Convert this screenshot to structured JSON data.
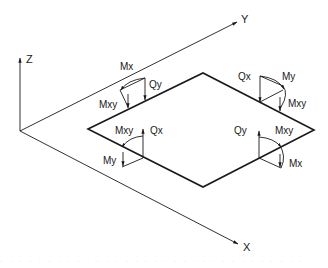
{
  "figure": {
    "colors": {
      "line": "#1a1a1a",
      "background": "#ffffff"
    }
  },
  "axes": {
    "z_label": "Z",
    "y_label": "Y",
    "x_label": "X"
  },
  "corners": {
    "top_left": {
      "shear": "Qy",
      "moment_arc": "Mx",
      "moment_vec": "Mxy"
    },
    "top_right": {
      "shear": "Qx",
      "moment_arc": "My",
      "moment_vec": "Mxy"
    },
    "bottom_left": {
      "shear": "Qx",
      "moment_arc": "Mxy",
      "moment_vec": "My"
    },
    "bottom_right": {
      "shear": "Qy",
      "moment_arc": "Mxy",
      "moment_vec": "Mx"
    }
  },
  "caption_faded": "· · · · · · · · · · · · · · · · · · · · · · · · · · · · · · · ·"
}
